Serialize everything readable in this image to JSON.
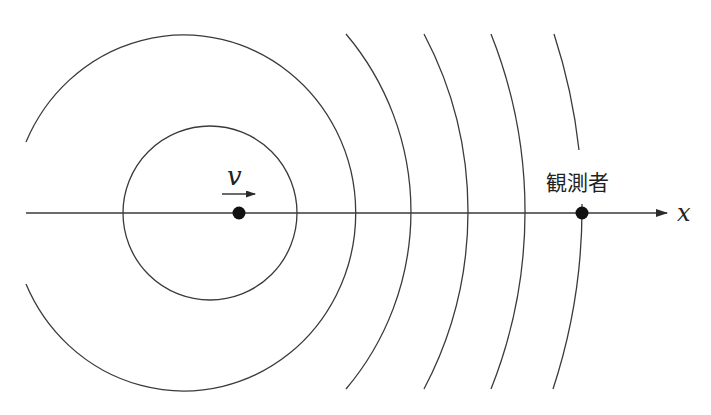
{
  "diagram": {
    "labels": {
      "velocity": "v",
      "axis": "x",
      "observer": "観測者"
    },
    "colors": {
      "background": "#ffffff",
      "stroke": "#3a3a3a",
      "dot": "#111111"
    },
    "axis": {
      "y": 213,
      "x_start": 26,
      "x_end": 667
    },
    "source": {
      "x": 239,
      "y": 213,
      "label": "v",
      "direction": "right"
    },
    "observer": {
      "x": 582,
      "y": 213,
      "label": "観測者"
    },
    "wavefronts": [
      {
        "type": "circle",
        "cx": 210,
        "cy": 213,
        "r": 86
      },
      {
        "type": "circle-partial",
        "cx": 183,
        "cy": 213,
        "r": 170,
        "note": "open on left side"
      },
      {
        "type": "arc",
        "axis_crossing_x": 411
      },
      {
        "type": "arc",
        "axis_crossing_x": 468
      },
      {
        "type": "arc",
        "axis_crossing_x": 525
      },
      {
        "type": "arc",
        "axis_crossing_x": 582
      }
    ]
  }
}
